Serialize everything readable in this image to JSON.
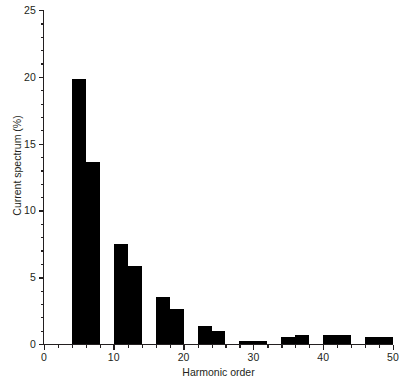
{
  "chart_data": {
    "type": "bar",
    "title": "",
    "xlabel": "Harmonic order",
    "ylabel": "Current spectrum (%)",
    "xlim": [
      0,
      50
    ],
    "ylim": [
      0,
      25
    ],
    "grid": false,
    "legend": null,
    "xticks": [
      0,
      10,
      20,
      30,
      40,
      50
    ],
    "xtick_labels": [
      "0",
      "10",
      "20",
      "30",
      "40",
      "50"
    ],
    "xminor_step": 2,
    "yticks": [
      0,
      5,
      10,
      15,
      20,
      25
    ],
    "ytick_labels": [
      "0",
      "5",
      "10",
      "15",
      "20",
      "25"
    ],
    "yminor_step": 1,
    "bar_color": "#000000",
    "axis_color": "#231f20",
    "bar_width_units": 2,
    "categories": [
      5,
      7,
      11,
      13,
      17,
      19,
      23,
      25,
      29,
      31,
      35,
      37,
      41,
      43,
      47,
      49
    ],
    "values": [
      19.8,
      13.6,
      7.5,
      5.85,
      3.5,
      2.6,
      1.35,
      0.95,
      0.25,
      0.25,
      0.5,
      0.65,
      0.65,
      0.7,
      0.55,
      0.55
    ]
  }
}
